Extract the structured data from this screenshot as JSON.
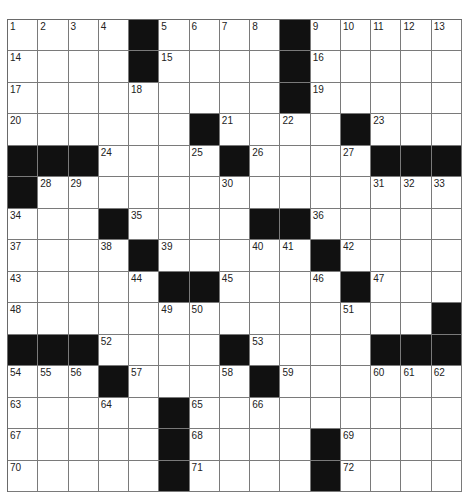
{
  "puzzle": {
    "rows": 15,
    "cols": 15,
    "colors": {
      "black": "#111111",
      "white": "#ffffff",
      "line": "#7a7a7a",
      "number": "#222222"
    },
    "grid": [
      [
        "1",
        "2",
        "3",
        "4",
        "#",
        "5",
        "6",
        "7",
        "8",
        "#",
        "9",
        "10",
        "11",
        "12",
        "13"
      ],
      [
        "14",
        "",
        "",
        "",
        "#",
        "15",
        "",
        "",
        "",
        "#",
        "16",
        "",
        "",
        "",
        ""
      ],
      [
        "17",
        "",
        "",
        "",
        "18",
        "",
        "",
        "",
        "",
        "#",
        "19",
        "",
        "",
        "",
        ""
      ],
      [
        "20",
        "",
        "",
        "",
        "",
        "",
        "#",
        "21",
        "",
        "22",
        "",
        "#",
        "23",
        "",
        ""
      ],
      [
        "#",
        "#",
        "#",
        "24",
        "",
        "",
        "25",
        "#",
        "26",
        "",
        "",
        "27",
        "#",
        "#",
        "#"
      ],
      [
        "#",
        "28",
        "29",
        "",
        "",
        "",
        "",
        "30",
        "",
        "",
        "",
        "",
        "31",
        "32",
        "33"
      ],
      [
        "34",
        "",
        "",
        "#",
        "35",
        "",
        "",
        "",
        "#",
        "#",
        "36",
        "",
        "",
        "",
        ""
      ],
      [
        "37",
        "",
        "",
        "38",
        "#",
        "39",
        "",
        "",
        "40",
        "41",
        "#",
        "42",
        "",
        "",
        ""
      ],
      [
        "43",
        "",
        "",
        "",
        "44",
        "#",
        "#",
        "45",
        "",
        "",
        "46",
        "#",
        "47",
        "",
        ""
      ],
      [
        "48",
        "",
        "",
        "",
        "",
        "49",
        "50",
        "",
        "",
        "",
        "",
        "51",
        "",
        "",
        "#"
      ],
      [
        "#",
        "#",
        "#",
        "52",
        "",
        "",
        "",
        "#",
        "53",
        "",
        "",
        "",
        "#",
        "#",
        "#"
      ],
      [
        "54",
        "55",
        "56",
        "#",
        "57",
        "",
        "",
        "58",
        "#",
        "59",
        "",
        "",
        "60",
        "61",
        "62"
      ],
      [
        "63",
        "",
        "",
        "64",
        "",
        "#",
        "65",
        "",
        "66",
        "",
        "",
        "",
        "",
        "",
        ""
      ],
      [
        "67",
        "",
        "",
        "",
        "",
        "#",
        "68",
        "",
        "",
        "",
        "#",
        "69",
        "",
        "",
        ""
      ],
      [
        "70",
        "",
        "",
        "",
        "",
        "#",
        "71",
        "",
        "",
        "",
        "#",
        "72",
        "",
        "",
        ""
      ]
    ],
    "letters": []
  }
}
